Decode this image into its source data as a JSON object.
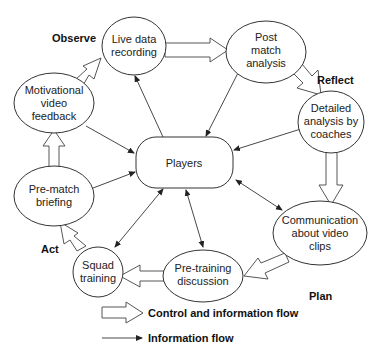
{
  "phases": {
    "observe": "Observe",
    "reflect": "Reflect",
    "plan": "Plan",
    "act": "Act"
  },
  "nodes": {
    "live_data": [
      "Live data",
      "recording"
    ],
    "post_match": [
      "Post",
      "match",
      "analysis"
    ],
    "detailed": [
      "Detailed",
      "analysis by",
      "coaches"
    ],
    "communication": [
      "Communication",
      "about video",
      "clips"
    ],
    "pre_training": [
      "Pre-training",
      "discussion"
    ],
    "squad": [
      "Squad",
      "training"
    ],
    "pre_match": [
      "Pre-match",
      "briefing"
    ],
    "motivational": [
      "Motivational",
      "video",
      "feedback"
    ],
    "players": [
      "Players"
    ]
  },
  "legend": {
    "control_flow": "Control and information flow",
    "info_flow": "Information flow"
  },
  "colors": {
    "stroke": "#333333",
    "background": "#ffffff"
  }
}
